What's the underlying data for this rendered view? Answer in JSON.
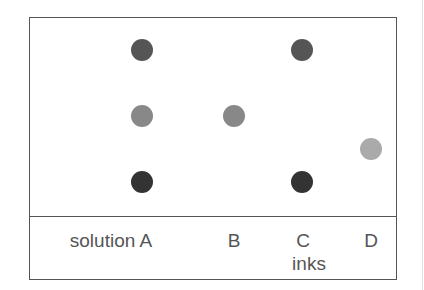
{
  "diagram": {
    "type": "paper chromatography result",
    "columns": [
      {
        "id": "A",
        "label": "solution A",
        "x": 142
      },
      {
        "id": "B",
        "label": "B",
        "x": 234
      },
      {
        "id": "C",
        "label": "C",
        "x": 302
      },
      {
        "id": "D",
        "label": "D",
        "x": 371
      }
    ],
    "axis_label": "inks",
    "spots": [
      {
        "column": "A",
        "y": 50,
        "color": "#555555"
      },
      {
        "column": "A",
        "y": 116,
        "color": "#888888"
      },
      {
        "column": "A",
        "y": 182,
        "color": "#333333"
      },
      {
        "column": "B",
        "y": 116,
        "color": "#888888"
      },
      {
        "column": "C",
        "y": 50,
        "color": "#555555"
      },
      {
        "column": "C",
        "y": 182,
        "color": "#333333"
      },
      {
        "column": "D",
        "y": 149,
        "color": "#aaaaaa"
      }
    ]
  }
}
